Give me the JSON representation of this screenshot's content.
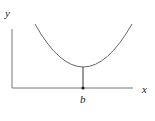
{
  "diagram": {
    "type": "function-minimum-plot",
    "axes": {
      "y_label": "y",
      "x_label": "x"
    },
    "curve": {
      "shape": "parabola (convex, U-shaped)",
      "minimum_label": "b"
    },
    "colors": {
      "axis": "#555555",
      "curve": "#666666",
      "text": "#222222",
      "background": "#ffffff"
    }
  }
}
